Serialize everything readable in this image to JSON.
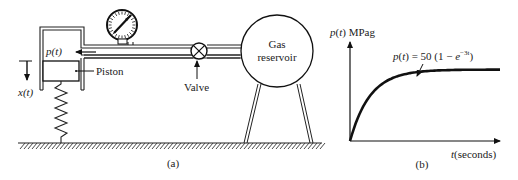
{
  "figure_a": {
    "caption": "(a)",
    "labels": {
      "pressure": "p(t)",
      "displacement": "x(t)",
      "piston": "Piston",
      "valve": "Valve",
      "reservoir_line1": "Gas",
      "reservoir_line2": "reservoir"
    },
    "components": [
      "pressure-gauge",
      "cylinder",
      "piston",
      "spring",
      "valve",
      "gas-reservoir",
      "ground"
    ]
  },
  "figure_b": {
    "caption": "(b)",
    "y_label": "p(t) MPag",
    "x_label": "t(seconds)",
    "equation": "p(t) = 50 (1 − e",
    "equation_exponent": "−3t",
    "equation_close": ")"
  },
  "chart_data": {
    "type": "line",
    "title": "",
    "xlabel": "t(seconds)",
    "ylabel": "p(t) MPag",
    "annotation": "p(t) = 50 (1 − e^{-3t})",
    "function": {
      "amplitude": 50,
      "rate": 3
    },
    "x": [
      0,
      0.1,
      0.2,
      0.3,
      0.4,
      0.5,
      0.6,
      0.8,
      1.0,
      1.2,
      1.5,
      2.0,
      2.5
    ],
    "series": [
      {
        "name": "p(t)",
        "values": [
          0,
          12.96,
          22.56,
          29.67,
          34.94,
          38.84,
          41.74,
          45.46,
          47.51,
          48.63,
          49.44,
          49.88,
          49.97
        ]
      }
    ],
    "xlim": [
      0,
      2.5
    ],
    "ylim": [
      0,
      70
    ],
    "grid": false,
    "legend": "none"
  }
}
